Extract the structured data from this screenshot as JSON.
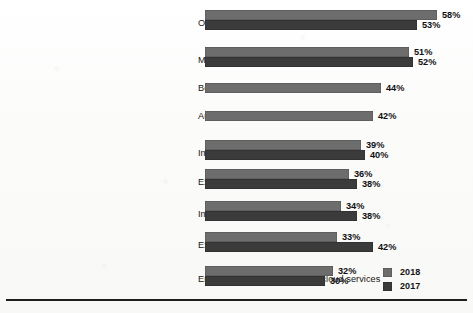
{
  "chart_data": {
    "type": "bar",
    "orientation": "horizontal",
    "title": "",
    "xlabel": "",
    "ylabel": "",
    "grid": false,
    "legend_position": "bottom-right",
    "value_suffix": "%",
    "xlim": [
      0,
      60
    ],
    "categories": [
      "Optimizing existing cloud use(cost savings)",
      "Moving more workloads to cloud",
      "Better financial reporting",
      "Automated policies for governance",
      "Implementing a cloud first strategy",
      "Expanding use of containers",
      "Implementing CI/CD in the cloud",
      "Expanding public clouds we use",
      "Enabling IT to broker multiple cloud services"
    ],
    "series": [
      {
        "name": "2018",
        "color": "#6d6d6d",
        "values": [
          58,
          51,
          44,
          42,
          39,
          36,
          34,
          33,
          32
        ],
        "labels": [
          "58%",
          "51%",
          "44%",
          "42%",
          "39%",
          "36%",
          "34%",
          "33%",
          "32%"
        ]
      },
      {
        "name": "2017",
        "color": "#3b3b3b",
        "values": [
          53,
          52,
          null,
          null,
          40,
          38,
          38,
          42,
          30
        ],
        "labels": [
          "53%",
          "52%",
          "",
          "",
          "40%",
          "38%",
          "38%",
          "42%",
          "30%"
        ]
      }
    ]
  },
  "legend": {
    "entries": [
      {
        "label": "2018",
        "color": "#6d6d6d"
      },
      {
        "label": "2017",
        "color": "#3b3b3b"
      }
    ]
  }
}
